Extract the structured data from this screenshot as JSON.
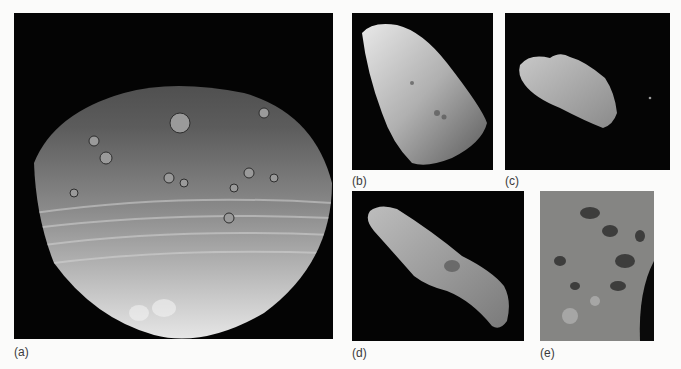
{
  "figure": {
    "panels": [
      {
        "id": "a",
        "label": "(a)",
        "subject": "asteroid-vesta",
        "description": "Large cratered asteroid with banded grooves, lit from below"
      },
      {
        "id": "b",
        "label": "(b)",
        "subject": "asteroid-gaspra",
        "description": "Elongated cratered asteroid, diagonal orientation"
      },
      {
        "id": "c",
        "label": "(c)",
        "subject": "asteroid-ida-with-moon",
        "description": "Elongated asteroid with small moon at right"
      },
      {
        "id": "d",
        "label": "(d)",
        "subject": "asteroid-eros",
        "description": "Long peanut-shaped asteroid"
      },
      {
        "id": "e",
        "label": "(e)",
        "subject": "asteroid-surface-closeup",
        "description": "Close-up of boulder-strewn asteroid surface"
      }
    ],
    "colors": {
      "background": "#fbfbfa",
      "space": "#050505",
      "label_text": "#3a3a3a"
    }
  }
}
